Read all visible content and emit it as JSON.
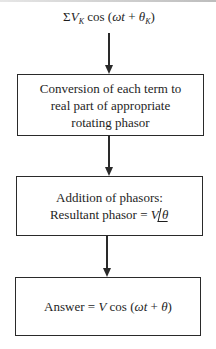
{
  "diagram": {
    "type": "flowchart",
    "input_expression": {
      "sigma": "Σ",
      "var": "V",
      "sub": "K",
      "func": " cos (",
      "omega_t": "ωt",
      "plus": " + ",
      "theta": "θ",
      "theta_sub": "K",
      "close": ")"
    },
    "steps": [
      {
        "id": "step-1",
        "lines": [
          "Conversion of each term to",
          "real part of appropriate",
          "rotating phasor"
        ]
      },
      {
        "id": "step-2",
        "line1": "Addition of phasors:",
        "line2_prefix": "Resultant phasor = ",
        "magnitude": "V",
        "angle": "θ"
      },
      {
        "id": "step-3",
        "prefix": "Answer = ",
        "var": "V",
        "func": " cos (",
        "omega_t": "ωt",
        "plus": " + ",
        "theta": "θ",
        "close": ")"
      }
    ],
    "connectors": [
      "input→step-1",
      "step-1→step-2",
      "step-2→step-3"
    ],
    "colors": {
      "line": "#2a2a2a",
      "text": "#1e1e1e",
      "background": "#ffffff"
    }
  }
}
